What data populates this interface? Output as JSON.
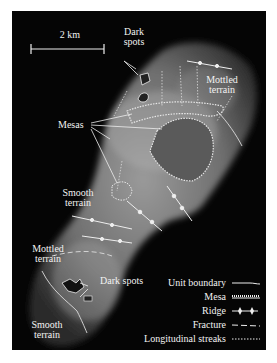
{
  "scale_bar": {
    "label": "2 km"
  },
  "labels": {
    "dark_spots_top": [
      "Dark",
      "spots"
    ],
    "mottled_terrain_top": [
      "Mottled",
      "terrain"
    ],
    "mesas": "Mesas",
    "smooth_terrain_mid": [
      "Smooth",
      "terrain"
    ],
    "mottled_terrain_bottom": [
      "Mottled",
      "terrain"
    ],
    "dark_spots_bottom": "Dark spots",
    "smooth_terrain_bottom": [
      "Smooth",
      "terrain"
    ]
  },
  "legend": {
    "items": [
      {
        "label": "Unit boundary",
        "symbol": "solid-line"
      },
      {
        "label": "Mesa",
        "symbol": "hatched-line"
      },
      {
        "label": "Ridge",
        "symbol": "diamond-ticked-line"
      },
      {
        "label": "Fracture",
        "symbol": "dashed-line"
      },
      {
        "label": "Longitudinal streaks",
        "symbol": "dotted-line"
      }
    ]
  },
  "colors": {
    "background": "#050505",
    "annotation": "#f2f2f2",
    "border": "#ffffff"
  }
}
